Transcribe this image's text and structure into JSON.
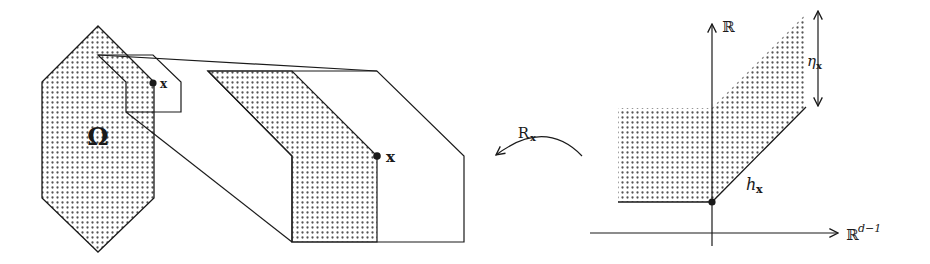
{
  "figure": {
    "left_panel": {
      "domain_label": "Ω",
      "point_label_small": "x",
      "point_label_large": "x"
    },
    "map_arrow": {
      "label_main": "R",
      "label_sub": "x"
    },
    "right_panel": {
      "y_axis_label": "ℝ",
      "x_axis_label_base": "ℝ",
      "x_axis_label_sup": "d−1",
      "height_label_main": "η",
      "height_label_sub": "x",
      "graph_label_main": "h",
      "graph_label_sub": "x"
    },
    "colors": {
      "stroke": "#1a1a1a",
      "dot_fill": "#555555",
      "background": "#ffffff"
    }
  }
}
